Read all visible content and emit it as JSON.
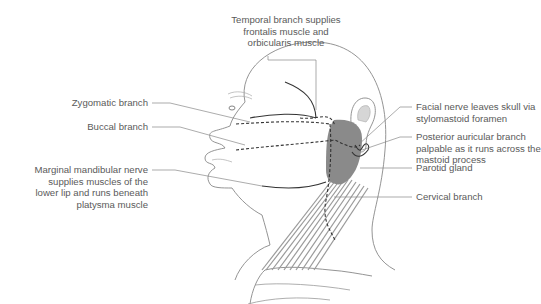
{
  "diagram": {
    "labels": {
      "temporal": [
        "Temporal branch supplies",
        "frontalis muscle and",
        "orbicularis muscle"
      ],
      "zygomatic": [
        "Zygomatic branch"
      ],
      "buccal": [
        "Buccal branch"
      ],
      "marginal": [
        "Marginal mandibular nerve",
        "supplies muscles of the",
        "lower lip and runs beneath",
        "platysma muscle"
      ],
      "facial_nerve": [
        "Facial nerve leaves skull via",
        "stylomastoid foramen"
      ],
      "posterior_auricular": [
        "Posterior auricular branch",
        "palpable as it runs across the",
        "mastoid process"
      ],
      "parotid": [
        "Parotid gland"
      ],
      "cervical": [
        "Cervical branch"
      ]
    },
    "colors": {
      "outline": "#777777",
      "nerve": "#333333",
      "parotid": "#8a8a8a",
      "platysma": "#9a9a9a",
      "leader": "#888888"
    }
  }
}
